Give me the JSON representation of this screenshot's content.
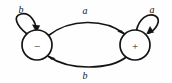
{
  "diagram": {
    "type": "state-transition-diagram",
    "background_color": "#fefefe",
    "stroke_color": "#141414",
    "states": [
      {
        "id": "minus",
        "label": "−",
        "cx": 37,
        "cy": 45,
        "r": 15
      },
      {
        "id": "plus",
        "label": "+",
        "cx": 135,
        "cy": 45,
        "r": 15
      }
    ],
    "transitions": [
      {
        "id": "loop-minus",
        "from": "minus",
        "to": "minus",
        "label": "b",
        "label_x": 21,
        "label_y": 13,
        "kind": "self-loop"
      },
      {
        "id": "minus-to-plus",
        "from": "minus",
        "to": "plus",
        "label": "a",
        "label_x": 85,
        "label_y": 14,
        "kind": "arc-top"
      },
      {
        "id": "plus-to-minus",
        "from": "plus",
        "to": "minus",
        "label": "b",
        "label_x": 85,
        "label_y": 79,
        "kind": "arc-bottom"
      },
      {
        "id": "loop-plus",
        "from": "plus",
        "to": "plus",
        "label": "a",
        "label_x": 152,
        "label_y": 13,
        "kind": "self-loop"
      }
    ]
  }
}
